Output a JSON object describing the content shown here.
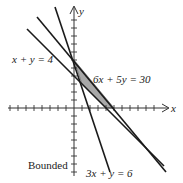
{
  "diagram": {
    "title": "Bounded",
    "axes": {
      "x_label": "x",
      "y_label": "y"
    },
    "lines": [
      {
        "id": "l1",
        "equation": "x + y = 4"
      },
      {
        "id": "l2",
        "equation": "6x + 5y = 30"
      },
      {
        "id": "l3",
        "equation": "3x + y = 6"
      }
    ],
    "region": {
      "label": "Bounded",
      "fill": "#a8a8a8"
    },
    "colors": {
      "line": "#1a1a1a",
      "axis": "#333333",
      "shade": "#a8a8a8"
    }
  }
}
